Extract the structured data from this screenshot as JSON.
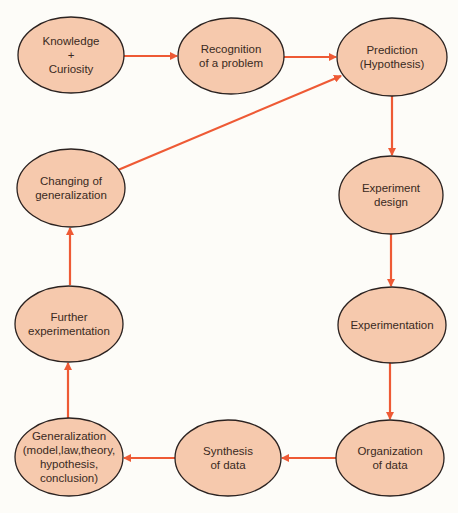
{
  "diagram": {
    "colors": {
      "node_fill": "#f6c9ad",
      "node_stroke": "#2b2220",
      "arrow": "#ee5a35",
      "background": "#fdfcf8"
    },
    "nodes": [
      {
        "id": "knowledge",
        "lines": [
          "Knowledge",
          "+",
          "Curiosity"
        ],
        "cx": 71,
        "cy": 55,
        "rx": 53,
        "ry": 38
      },
      {
        "id": "recognition",
        "lines": [
          "Recognition",
          "of a problem"
        ],
        "cx": 231,
        "cy": 56,
        "rx": 53,
        "ry": 38
      },
      {
        "id": "prediction",
        "lines": [
          "Prediction",
          "(Hypothesis)"
        ],
        "cx": 392,
        "cy": 57,
        "rx": 55,
        "ry": 39
      },
      {
        "id": "experiment-design",
        "lines": [
          "Experiment",
          "design"
        ],
        "cx": 391,
        "cy": 195,
        "rx": 52,
        "ry": 39
      },
      {
        "id": "experimentation",
        "lines": [
          "Experimentation"
        ],
        "cx": 392,
        "cy": 325,
        "rx": 54,
        "ry": 38
      },
      {
        "id": "organization",
        "lines": [
          "Organization",
          "of data"
        ],
        "cx": 390,
        "cy": 458,
        "rx": 54,
        "ry": 38
      },
      {
        "id": "synthesis",
        "lines": [
          "Synthesis",
          "of data"
        ],
        "cx": 228,
        "cy": 458,
        "rx": 53,
        "ry": 38
      },
      {
        "id": "generalization",
        "lines": [
          "Generalization",
          "(model,law,theory,",
          "hypothesis,",
          "conclusion)"
        ],
        "cx": 69,
        "cy": 457,
        "rx": 54,
        "ry": 39
      },
      {
        "id": "further-experimentation",
        "lines": [
          "Further",
          "experimentation"
        ],
        "cx": 69,
        "cy": 324,
        "rx": 54,
        "ry": 38
      },
      {
        "id": "changing-generalization",
        "lines": [
          "Changing of",
          "generalization"
        ],
        "cx": 71,
        "cy": 188,
        "rx": 54,
        "ry": 39
      }
    ],
    "edges": [
      {
        "from": "knowledge",
        "to": "recognition",
        "x1": 124,
        "y1": 56,
        "x2": 177,
        "y2": 56
      },
      {
        "from": "recognition",
        "to": "prediction",
        "x1": 284,
        "y1": 57,
        "x2": 336,
        "y2": 57
      },
      {
        "from": "prediction",
        "to": "experiment-design",
        "x1": 392,
        "y1": 96,
        "x2": 392,
        "y2": 155
      },
      {
        "from": "experiment-design",
        "to": "experimentation",
        "x1": 391,
        "y1": 234,
        "x2": 391,
        "y2": 286
      },
      {
        "from": "experimentation",
        "to": "organization",
        "x1": 390,
        "y1": 363,
        "x2": 390,
        "y2": 419
      },
      {
        "from": "organization",
        "to": "synthesis",
        "x1": 336,
        "y1": 458,
        "x2": 282,
        "y2": 458
      },
      {
        "from": "synthesis",
        "to": "generalization",
        "x1": 175,
        "y1": 458,
        "x2": 124,
        "y2": 458
      },
      {
        "from": "generalization",
        "to": "further-experimentation",
        "x1": 68,
        "y1": 418,
        "x2": 68,
        "y2": 363
      },
      {
        "from": "further-experimentation",
        "to": "changing-generalization",
        "x1": 70,
        "y1": 285,
        "x2": 70,
        "y2": 228
      },
      {
        "from": "changing-generalization",
        "to": "prediction",
        "x1": 118,
        "y1": 170,
        "x2": 341,
        "y2": 76
      }
    ]
  }
}
